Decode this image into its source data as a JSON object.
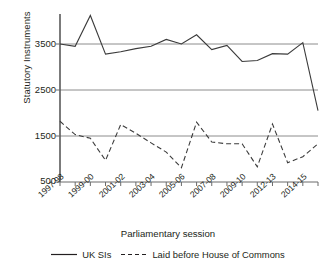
{
  "chart_data": {
    "type": "line",
    "title": "",
    "xlabel": "Parliamentary session",
    "ylabel": "Statutory Instruments",
    "grid": true,
    "legend_position": "bottom",
    "ylim": [
      500,
      4300
    ],
    "yticks": [
      500,
      1500,
      2500,
      3500
    ],
    "ytick_labels": [
      "500",
      "1500",
      "2500",
      "3500"
    ],
    "categories": [
      "1997-98",
      "1998-99",
      "1999-00",
      "2000-01",
      "2001-02",
      "2002-03",
      "2003-04",
      "2004-05",
      "2005-06",
      "2006-07",
      "2007-08",
      "2008-09",
      "2009-10",
      "2010-12",
      "2012-13",
      "2013-14",
      "2014-15",
      "2015-16"
    ],
    "xtick_labels": [
      "1997-98",
      "1999-00",
      "2001-02",
      "2003-04",
      "2005-06",
      "2007-08",
      "2009-10",
      "2012-13",
      "2014-15"
    ],
    "xtick_indices": [
      0,
      2,
      4,
      6,
      8,
      10,
      12,
      14,
      16
    ],
    "series": [
      {
        "name": "UK SIs",
        "style": "solid",
        "color": "#3b3b3b",
        "values": [
          3500,
          3450,
          4120,
          3280,
          3330,
          3400,
          3450,
          3600,
          3500,
          3700,
          3380,
          3470,
          3120,
          3140,
          3290,
          3280,
          3530,
          2050
        ]
      },
      {
        "name": "Laid before House of Commons",
        "style": "dashed",
        "color": "#3b3b3b",
        "values": [
          1820,
          1530,
          1450,
          970,
          1750,
          1560,
          1350,
          1150,
          810,
          1800,
          1370,
          1330,
          1330,
          830,
          1760,
          920,
          1050,
          1330
        ]
      }
    ]
  },
  "legend": {
    "entries": [
      {
        "label": "UK SIs",
        "style": "solid"
      },
      {
        "label": "Laid before House of Commons",
        "style": "dashed"
      }
    ]
  },
  "axes": {
    "y_title": "Statutory Instruments",
    "x_title": "Parliamentary session"
  }
}
